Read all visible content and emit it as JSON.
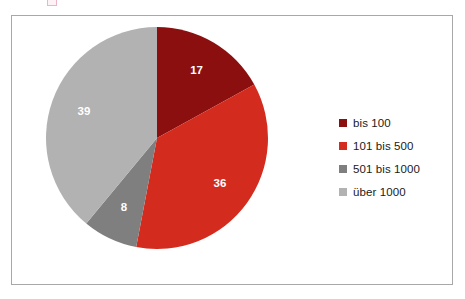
{
  "frame": {
    "border_color": "#a8a8a8",
    "background": "#ffffff"
  },
  "chart_data": {
    "type": "pie",
    "title": "",
    "subtitle": "",
    "xlabel": "",
    "ylabel": "",
    "categories": [
      "bis 100",
      "101 bis 500",
      "501 bis 1000",
      "über 1000"
    ],
    "values": [
      17,
      36,
      8,
      39
    ],
    "data_labels": [
      "17",
      "36",
      "8",
      "39"
    ],
    "colors": [
      "#8b0f0f",
      "#d42b1f",
      "#7f7f7f",
      "#b2b2b2"
    ],
    "data_label_color": "#ffffff",
    "start_angle_deg": 0,
    "direction": "clockwise",
    "total": 100,
    "legend_position": "right",
    "grid": false
  },
  "legend": {
    "items": [
      {
        "label": "bis 100",
        "color": "#8b0f0f"
      },
      {
        "label": "101 bis 500",
        "color": "#d42b1f"
      },
      {
        "label": "501 bis 1000",
        "color": "#7f7f7f"
      },
      {
        "label": "über 1000",
        "color": "#b2b2b2"
      }
    ]
  },
  "artifact": {
    "present": true,
    "color": "#e8a9bd"
  }
}
